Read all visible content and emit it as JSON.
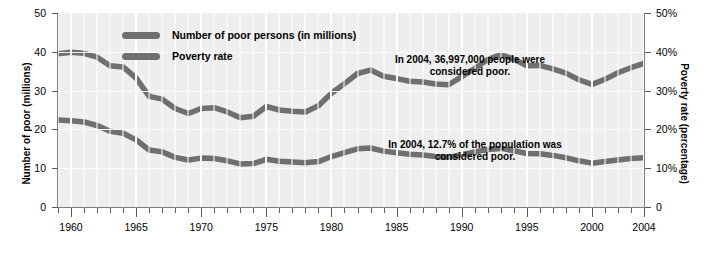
{
  "chart_data": {
    "type": "line",
    "title": "",
    "xlabel": "",
    "x": [
      1959,
      1960,
      1961,
      1962,
      1963,
      1964,
      1965,
      1966,
      1967,
      1968,
      1969,
      1970,
      1971,
      1972,
      1973,
      1974,
      1975,
      1976,
      1977,
      1978,
      1979,
      1980,
      1981,
      1982,
      1983,
      1984,
      1985,
      1986,
      1987,
      1988,
      1989,
      1990,
      1991,
      1992,
      1993,
      1994,
      1995,
      1996,
      1997,
      1998,
      1999,
      2000,
      2001,
      2002,
      2003,
      2004
    ],
    "xlim": [
      1959,
      2004
    ],
    "xticks_major": [
      1960,
      1965,
      1970,
      1975,
      1980,
      1985,
      1990,
      1995,
      2000,
      2004
    ],
    "xtick_labels": [
      "1960",
      "1965",
      "1970",
      "1975",
      "1980",
      "1985",
      "1990",
      "1995",
      "2000",
      "2004"
    ],
    "xticks_minor_every": 1,
    "grid": "vertical-white",
    "legend_position": "upper-left-inside",
    "axes": [
      {
        "side": "left",
        "label": "Number of poor (millions)",
        "lim": [
          0,
          50
        ],
        "ticks": [
          0,
          10,
          20,
          30,
          40,
          50
        ],
        "tick_labels": [
          "0",
          "10",
          "20",
          "30",
          "40",
          "50"
        ]
      },
      {
        "side": "right",
        "label": "Poverty rate (percentage)",
        "lim": [
          0,
          50
        ],
        "ticks": [
          0,
          10,
          20,
          30,
          40,
          50
        ],
        "tick_labels": [
          "0",
          "10%",
          "20%",
          "30%",
          "40%",
          "50%"
        ]
      }
    ],
    "series": [
      {
        "name": "Number of poor persons (in millions)",
        "axis": "left",
        "color": "#6f6f6f",
        "values": [
          39.5,
          39.9,
          39.6,
          38.6,
          36.4,
          36.1,
          33.2,
          28.5,
          27.8,
          25.4,
          24.1,
          25.4,
          25.6,
          24.5,
          23.0,
          23.4,
          25.9,
          25.0,
          24.7,
          24.5,
          26.1,
          29.3,
          31.8,
          34.4,
          35.3,
          33.7,
          33.1,
          32.4,
          32.2,
          31.7,
          31.5,
          33.6,
          35.7,
          38.0,
          39.3,
          38.1,
          36.4,
          36.5,
          35.6,
          34.5,
          32.8,
          31.6,
          32.9,
          34.6,
          35.9,
          37.0
        ]
      },
      {
        "name": "Poverty rate",
        "axis": "right",
        "color": "#6f6f6f",
        "values": [
          22.4,
          22.2,
          21.9,
          21.0,
          19.5,
          19.0,
          17.3,
          14.7,
          14.2,
          12.8,
          12.1,
          12.6,
          12.5,
          11.9,
          11.1,
          11.2,
          12.3,
          11.8,
          11.6,
          11.4,
          11.7,
          13.0,
          14.0,
          15.0,
          15.2,
          14.4,
          14.0,
          13.6,
          13.4,
          13.0,
          12.8,
          13.5,
          14.2,
          14.8,
          15.1,
          14.5,
          13.8,
          13.7,
          13.3,
          12.7,
          11.9,
          11.3,
          11.7,
          12.1,
          12.5,
          12.7
        ]
      }
    ],
    "annotations": [
      {
        "id": "number-annotation",
        "text": "In 2004, 36,997,000 people were\nconsidered poor.",
        "refers_to": "Number of poor persons (in millions)"
      },
      {
        "id": "rate-annotation",
        "text": "In 2004, 12.7% of the population was\nconsidered poor.",
        "refers_to": "Poverty rate"
      }
    ]
  },
  "legend": {
    "items": [
      {
        "label": "Number of poor persons (in millions)",
        "color": "#6f6f6f"
      },
      {
        "label": "Poverty rate",
        "color": "#6f6f6f"
      }
    ]
  },
  "axis_left": {
    "title": "Number of poor (millions)",
    "labels": [
      "50",
      "40",
      "30",
      "20",
      "10",
      "0"
    ]
  },
  "axis_right": {
    "title": "Poverty rate (percentage)",
    "labels": [
      "50%",
      "40%",
      "30%",
      "20%",
      "10%",
      "0"
    ]
  },
  "axis_x": {
    "labels": [
      "1960",
      "1965",
      "1970",
      "1975",
      "1980",
      "1985",
      "1990",
      "1995",
      "2000",
      "2004"
    ]
  },
  "annotations": {
    "number": "In 2004, 36,997,000 people were\nconsidered poor.",
    "rate": "In 2004, 12.7% of the population was\nconsidered poor."
  }
}
